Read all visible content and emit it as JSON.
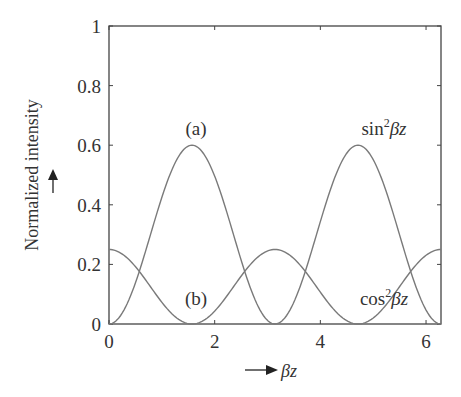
{
  "chart_data": {
    "type": "line",
    "title": "",
    "xlabel": "βz",
    "ylabel": "Normalized intensity",
    "xlim": [
      0,
      6.2832
    ],
    "ylim": [
      0,
      1
    ],
    "xticks": [
      0,
      2,
      4,
      6
    ],
    "xtick_labels": [
      "0",
      "2",
      "4",
      "6"
    ],
    "yticks": [
      0,
      0.2,
      0.4,
      0.6,
      0.8,
      1
    ],
    "ytick_labels": [
      "0",
      "0.2",
      "0.4",
      "0.6",
      "0.8",
      "1"
    ],
    "grid": false,
    "legend": null,
    "series": [
      {
        "name": "sin²βz",
        "label": "(a)",
        "formula": "0.6*sin^2(βz)",
        "amplitude": 0.6,
        "color": "#7a7a7a",
        "x": [
          0,
          0.785,
          1.571,
          2.356,
          3.142,
          3.927,
          4.712,
          5.498,
          6.283
        ],
        "values": [
          0,
          0.3,
          0.6,
          0.3,
          0,
          0.3,
          0.6,
          0.3,
          0
        ]
      },
      {
        "name": "cos²βz",
        "label": "(b)",
        "formula": "0.25*cos^2(βz)",
        "amplitude": 0.25,
        "color": "#7a7a7a",
        "x": [
          0,
          0.785,
          1.571,
          2.356,
          3.142,
          3.927,
          4.712,
          5.498,
          6.283
        ],
        "values": [
          0.25,
          0.125,
          0,
          0.125,
          0.25,
          0.125,
          0,
          0.125,
          0.25
        ]
      }
    ],
    "annotations": [
      {
        "text": "(a)",
        "x": 1.571,
        "y": 0.64
      },
      {
        "text": "(b)",
        "x": 1.571,
        "y": 0.1
      },
      {
        "text_main": "sin",
        "sup": "2",
        "text_tail": "βz",
        "x": 4.712,
        "y": 0.64
      },
      {
        "text_main": "cos",
        "sup": "2",
        "text_tail": "βz",
        "x": 4.712,
        "y": 0.1
      }
    ]
  },
  "labels": {
    "ylabel": "Normalized intensity",
    "xlabel": "βz",
    "ann_a": "(a)",
    "ann_b": "(b)",
    "sin_main": "sin",
    "sin_sup": "2",
    "sin_tail": "βz",
    "cos_main": "cos",
    "cos_sup": "2",
    "cos_tail": "βz"
  }
}
